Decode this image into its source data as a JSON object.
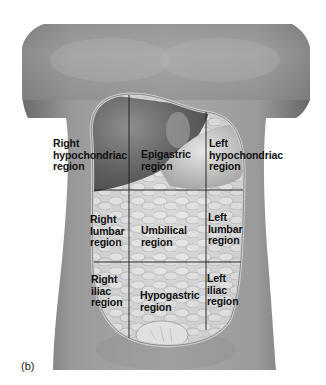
{
  "figure": {
    "panel_label": "(b)",
    "corner_mark": "...",
    "colors": {
      "skin_light": "#a8a8a8",
      "skin_dark": "#6e6e6e",
      "organ_light": "#dcdcdc",
      "organ_dark": "#8a8a8a",
      "outline": "#c8c8c8",
      "grid_line": "#1a1a1a",
      "label_text": "#111111"
    },
    "regions": [
      {
        "id": "right-hypochondriac",
        "label": "Right\nhypochondriac\nregion"
      },
      {
        "id": "epigastric",
        "label": "Epigastric\nregion"
      },
      {
        "id": "left-hypochondriac",
        "label": "Left\nhypochondriac\nregion"
      },
      {
        "id": "right-lumbar",
        "label": "Right\nlumbar\nregion"
      },
      {
        "id": "umbilical",
        "label": "Umbilical\nregion"
      },
      {
        "id": "left-lumbar",
        "label": "Left\nlumbar\nregion"
      },
      {
        "id": "right-iliac",
        "label": "Right\niliac\nregion"
      },
      {
        "id": "hypogastric",
        "label": "Hypogastric\nregion"
      },
      {
        "id": "left-iliac",
        "label": "Left\niliac\nregion"
      }
    ]
  }
}
